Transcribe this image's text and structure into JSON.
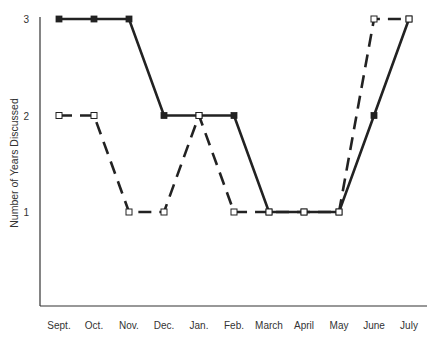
{
  "chart_data": {
    "type": "line",
    "title": "",
    "xlabel": "",
    "ylabel": "Number of Years Discussed",
    "categories": [
      "Sept.",
      "Oct.",
      "Nov.",
      "Dec.",
      "Jan.",
      "Feb.",
      "March",
      "April",
      "May",
      "June",
      "July"
    ],
    "yticks": [
      1,
      2,
      3
    ],
    "ylim": [
      0,
      3
    ],
    "grid": false,
    "legend": null,
    "series": [
      {
        "name": "Series A (solid, filled squares)",
        "style": "solid",
        "marker": "filled-square",
        "color": "#222222",
        "values": [
          3,
          3,
          3,
          2,
          2,
          2,
          1,
          1,
          1,
          2,
          3
        ]
      },
      {
        "name": "Series B (dashed, open squares)",
        "style": "dashed",
        "marker": "open-square",
        "color": "#222222",
        "values": [
          2,
          2,
          1,
          1,
          2,
          1,
          1,
          1,
          1,
          3,
          3
        ]
      }
    ]
  }
}
